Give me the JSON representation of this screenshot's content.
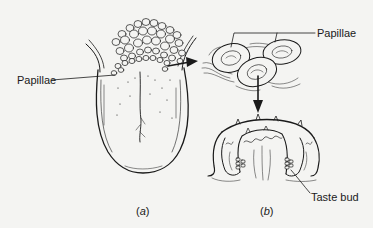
{
  "figure": {
    "panel_a": {
      "caption_letter": "a",
      "labels": {
        "papillae": "Papillae"
      }
    },
    "panel_b": {
      "caption_letter": "b",
      "labels": {
        "papillae": "Papillae",
        "taste_bud": "Taste bud"
      }
    }
  },
  "colors": {
    "background": "#f4f4f2",
    "ink": "#1a1a1a"
  }
}
